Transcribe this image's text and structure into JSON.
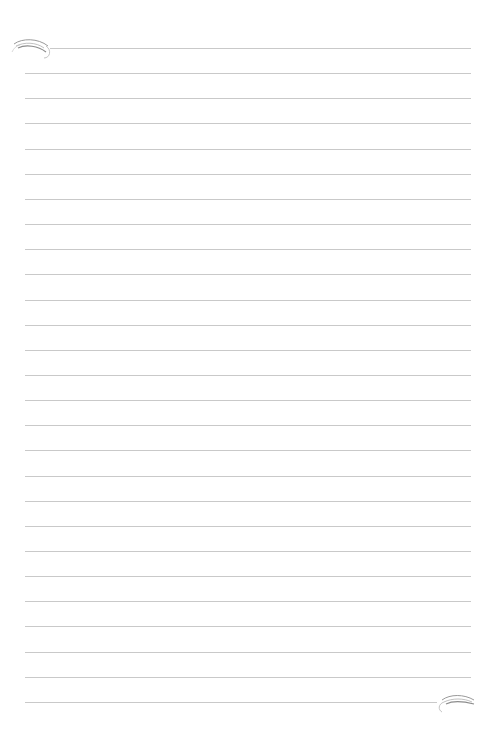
{
  "page": {
    "type": "lined-paper",
    "background": "#ffffff",
    "line_color": "#c9c9c9",
    "line_count": 27,
    "first_line_y": 48,
    "line_spacing": 25.15,
    "line_left": 25,
    "line_right": 471,
    "first_line_left": 50,
    "last_line_right": 437
  },
  "decorations": [
    {
      "name": "top-left-flourish",
      "position": "top-left"
    },
    {
      "name": "bottom-right-flourish",
      "position": "bottom-right"
    }
  ]
}
